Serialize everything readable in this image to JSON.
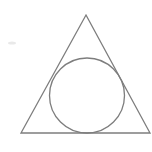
{
  "figure": {
    "background_color": "#ffffff",
    "canvas": {
      "width": 152,
      "height": 152
    },
    "stroke_color": "#7d7d7d",
    "stroke_width": 1.3,
    "fill": "none"
  },
  "chart_data": {
    "type": "diagram",
    "xlabel": "",
    "ylabel": "",
    "grid": false,
    "legend": null,
    "axis_visible": false,
    "xlim": [
      0,
      152
    ],
    "ylim": [
      0,
      152
    ],
    "shapes": [
      {
        "name": "triangle",
        "kind": "polygon",
        "vertices": [
          [
            86,
            15
          ],
          [
            150,
            133
          ],
          [
            21,
            133
          ]
        ],
        "stroke": "#7d7d7d",
        "stroke_width": 1.3,
        "fill": "none",
        "points_attr": "86,15 150,133 21,133"
      },
      {
        "name": "inscribed-circle",
        "kind": "circle",
        "cx": 87,
        "cy": 95.5,
        "r": 37.5,
        "stroke": "#7d7d7d",
        "stroke_width": 1.3,
        "fill": "none"
      },
      {
        "name": "scan-artifact-smudge",
        "kind": "ellipse",
        "cx": 12,
        "cy": 43,
        "rx": 4,
        "ry": 1.6,
        "fill": "#e9e9e9"
      }
    ]
  }
}
